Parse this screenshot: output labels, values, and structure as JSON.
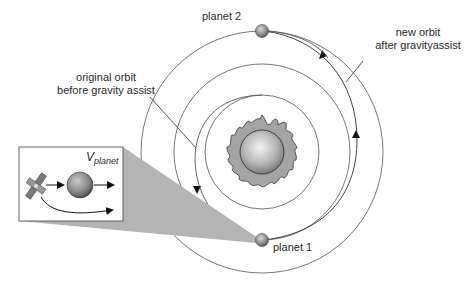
{
  "diagram": {
    "labels": {
      "planet2": "planet 2",
      "planet1": "planet 1",
      "new_orbit_line1": "new orbit",
      "new_orbit_line2": "after gravityassist",
      "original_orbit_line1": "original orbit",
      "original_orbit_line2": "before gravity assist",
      "velocity_symbol": "V",
      "velocity_subscript": "planet"
    },
    "nodes": [
      {
        "id": "sun",
        "label": "",
        "icon": "sun-icon"
      },
      {
        "id": "planet1",
        "label": "planet 1",
        "icon": "planet-icon"
      },
      {
        "id": "planet2",
        "label": "planet 2",
        "icon": "planet-icon"
      },
      {
        "id": "satellite",
        "label": "",
        "icon": "satellite-icon"
      }
    ],
    "orbits": [
      {
        "id": "inner-orbit"
      },
      {
        "id": "planet1-orbit"
      },
      {
        "id": "planet2-orbit"
      },
      {
        "id": "original-transfer-orbit",
        "label": "original orbit before gravity assist"
      },
      {
        "id": "new-transfer-orbit",
        "label": "new orbit after gravityassist"
      }
    ],
    "inset": {
      "description": "satellite flyby of planet",
      "velocity_label": "V planet"
    },
    "colors": {
      "line": "#555555",
      "wedge": "#b4b4b4",
      "sun_flame": "#9a9a9a",
      "planet": "#8c8c8c"
    }
  }
}
